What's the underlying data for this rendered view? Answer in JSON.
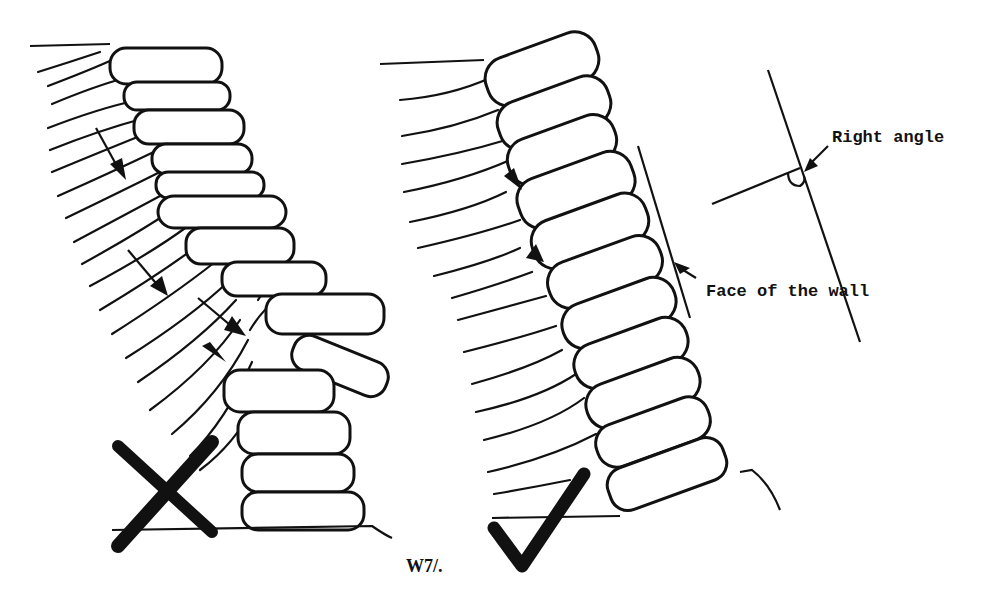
{
  "figure": {
    "caption": "W7/.",
    "panels": [
      {
        "id": "incorrect",
        "verdict": "wrong",
        "mark": "cross-mark",
        "description": "Stones laid flat/horizontal, wall bulging and collapsing under soil pressure"
      },
      {
        "id": "correct",
        "verdict": "right",
        "mark": "check-mark",
        "description": "Stones tilted into the bank at right angle to wall face"
      }
    ],
    "labels": {
      "right_angle": "Right angle",
      "face_of_wall": "Face of the wall"
    },
    "colors": {
      "ink": "#111111",
      "background": "#ffffff"
    }
  }
}
